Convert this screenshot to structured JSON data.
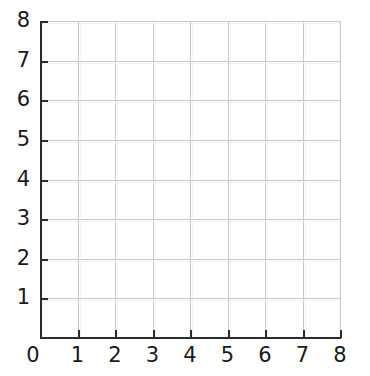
{
  "chart_data": {
    "type": "scatter",
    "title": "",
    "subtitle": "",
    "xlabel": "",
    "ylabel": "",
    "x": [],
    "y": [],
    "series": [],
    "annotations": [],
    "legend": [],
    "legend_position": "none",
    "grid": true,
    "xlim": [
      0,
      8
    ],
    "ylim": [
      0,
      8
    ],
    "xticks": [
      0,
      1,
      2,
      3,
      4,
      5,
      6,
      7,
      8
    ],
    "yticks": [
      0,
      1,
      2,
      3,
      4,
      5,
      6,
      7,
      8
    ],
    "xtick_labels": [
      "0",
      "1",
      "2",
      "3",
      "4",
      "5",
      "6",
      "7",
      "8"
    ],
    "ytick_labels": [
      "0",
      "1",
      "2",
      "3",
      "4",
      "5",
      "6",
      "7",
      "8"
    ]
  },
  "axes": {
    "origin_label": "0",
    "x_labels": [
      "1",
      "2",
      "3",
      "4",
      "5",
      "6",
      "7",
      "8"
    ],
    "y_labels": [
      "8",
      "7",
      "6",
      "5",
      "4",
      "3",
      "2",
      "1"
    ]
  },
  "colors": {
    "background": "#ffffff",
    "axis": "#2b2b2b",
    "grid_major": "#c9c9c9",
    "grid_minor": "#e8e8e8",
    "text": "#1a1a1a"
  }
}
